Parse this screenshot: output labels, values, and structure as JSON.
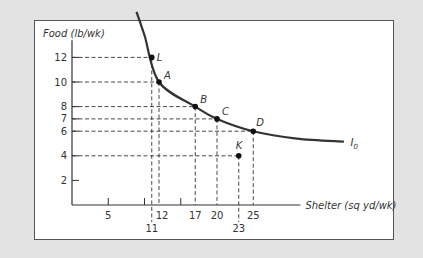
{
  "chart_data": {
    "type": "line",
    "title": "",
    "xlabel": "Shelter (sq yd/wk)",
    "ylabel": "Food (lb/wk)",
    "x_ticks": [
      5,
      11,
      12,
      17,
      20,
      23,
      25
    ],
    "x_minor_ticks": [
      10,
      15
    ],
    "y_ticks": [
      2,
      4,
      6,
      7,
      8,
      10,
      12
    ],
    "curve_label": "I0",
    "series": [
      {
        "name": "I0",
        "type": "curve",
        "points": [
          [
            10,
            14
          ],
          [
            12,
            10
          ],
          [
            17,
            8
          ],
          [
            20,
            7
          ],
          [
            25,
            6
          ],
          [
            37,
            5.1
          ]
        ]
      }
    ],
    "points": [
      {
        "label": "L",
        "x": 11,
        "y": 12
      },
      {
        "label": "A",
        "x": 12,
        "y": 10
      },
      {
        "label": "B",
        "x": 17,
        "y": 8
      },
      {
        "label": "C",
        "x": 20,
        "y": 7
      },
      {
        "label": "D",
        "x": 25,
        "y": 6
      },
      {
        "label": "K",
        "x": 23,
        "y": 4
      }
    ],
    "grid": false,
    "legend": "none"
  },
  "labels": {
    "ylabel": "Food (lb/wk)",
    "xlabel": "Shelter (sq yd/wk)",
    "curve": "I",
    "curve_sub": "0"
  }
}
